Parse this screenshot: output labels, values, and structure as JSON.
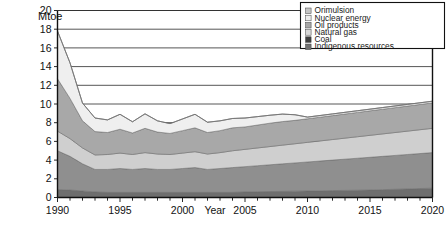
{
  "chart_data": {
    "type": "area",
    "stacked": true,
    "title": "",
    "unit_label": "Mtoe",
    "xlabel": "Year",
    "ylabel": "",
    "xlim": [
      1990,
      2020
    ],
    "ylim": [
      0,
      20
    ],
    "ytick_step": 2,
    "yticks": [
      0,
      2,
      4,
      6,
      8,
      10,
      12,
      14,
      16,
      18,
      20
    ],
    "xticks_labeled": [
      1990,
      1995,
      2000,
      2005,
      2010,
      2015,
      2020
    ],
    "xtick_step_minor": 1,
    "grid": "horizontal",
    "legend_position": "top-right",
    "x": [
      1990,
      1991,
      1992,
      1993,
      1994,
      1995,
      1996,
      1997,
      1998,
      1999,
      2000,
      2001,
      2002,
      2003,
      2004,
      2005,
      2006,
      2007,
      2008,
      2009,
      2010,
      2011,
      2012,
      2013,
      2014,
      2015,
      2016,
      2017,
      2018,
      2019,
      2020
    ],
    "series": [
      {
        "name": "Indigenous resources",
        "color": "#6e6e6e",
        "values": [
          0.85,
          0.8,
          0.7,
          0.6,
          0.55,
          0.55,
          0.55,
          0.55,
          0.55,
          0.55,
          0.55,
          0.55,
          0.55,
          0.55,
          0.55,
          0.6,
          0.62,
          0.64,
          0.66,
          0.68,
          0.7,
          0.72,
          0.74,
          0.76,
          0.78,
          0.8,
          0.84,
          0.88,
          0.92,
          0.96,
          1.0
        ]
      },
      {
        "name": "Coal",
        "color": "#8f8f8f",
        "values": [
          4.15,
          3.6,
          2.9,
          2.4,
          2.45,
          2.55,
          2.45,
          2.55,
          2.45,
          2.45,
          2.55,
          2.65,
          2.45,
          2.55,
          2.65,
          2.7,
          2.78,
          2.86,
          2.94,
          3.02,
          3.1,
          3.18,
          3.26,
          3.34,
          3.42,
          3.5,
          3.56,
          3.62,
          3.68,
          3.74,
          3.8
        ]
      },
      {
        "name": "Natural gas",
        "color": "#cfcfcf",
        "values": [
          2.1,
          1.9,
          1.7,
          1.55,
          1.6,
          1.65,
          1.6,
          1.7,
          1.65,
          1.6,
          1.65,
          1.7,
          1.65,
          1.7,
          1.8,
          1.85,
          1.9,
          1.95,
          2.0,
          2.05,
          2.1,
          2.15,
          2.2,
          2.25,
          2.3,
          2.35,
          2.4,
          2.45,
          2.5,
          2.55,
          2.6
        ]
      },
      {
        "name": "Oil products",
        "color": "#a8a8a8",
        "values": [
          5.6,
          4.3,
          2.9,
          2.5,
          2.35,
          2.55,
          2.3,
          2.6,
          2.35,
          2.25,
          2.4,
          2.55,
          2.3,
          2.35,
          2.45,
          2.4,
          2.45,
          2.5,
          2.52,
          2.5,
          2.52,
          2.54,
          2.56,
          2.58,
          2.6,
          2.62,
          2.64,
          2.66,
          2.68,
          2.7,
          2.72
        ]
      },
      {
        "name": "Nuclear energy",
        "color": "#efefef",
        "values": [
          5.1,
          3.8,
          1.9,
          1.45,
          1.35,
          1.6,
          1.2,
          1.55,
          1.2,
          1.05,
          1.25,
          1.45,
          1.1,
          1.05,
          1.0,
          0.95,
          0.9,
          0.85,
          0.8,
          0.6,
          0.18,
          0.18,
          0.18,
          0.18,
          0.18,
          0.18,
          0.18,
          0.18,
          0.18,
          0.18,
          0.18
        ]
      },
      {
        "name": "Orimulsion",
        "color": "#bdbdbd",
        "values": [
          0.0,
          0.0,
          0.0,
          0.0,
          0.0,
          0.0,
          0.0,
          0.0,
          0.0,
          0.0,
          0.0,
          0.0,
          0.0,
          0.0,
          0.0,
          0.0,
          0.0,
          0.0,
          0.0,
          0.0,
          0.0,
          0.0,
          0.0,
          0.0,
          0.0,
          0.0,
          0.0,
          0.0,
          0.0,
          0.0,
          0.0
        ]
      }
    ],
    "totals": [
      17.8,
      14.4,
      10.1,
      8.5,
      8.3,
      8.9,
      8.1,
      8.95,
      8.2,
      7.9,
      8.4,
      8.9,
      8.05,
      8.2,
      8.45,
      8.5,
      8.65,
      8.8,
      8.92,
      8.85,
      8.6,
      8.77,
      8.94,
      9.11,
      9.28,
      9.45,
      9.62,
      9.79,
      9.96,
      10.13,
      10.3
    ]
  },
  "legend": {
    "items": [
      {
        "label": "Orimulsion",
        "swatch": "#c4c4c4"
      },
      {
        "label": "Nuclear energy",
        "swatch": "#ececec"
      },
      {
        "label": "Oil products",
        "swatch": "#a6a6a6"
      },
      {
        "label": "Natural gas",
        "swatch": "#d8d8d8"
      },
      {
        "label": "Coal",
        "swatch": "#3f3f3f"
      },
      {
        "label": "Indigenous resources",
        "swatch": "#717171"
      }
    ]
  },
  "axis": {
    "y_labels": [
      "20",
      "18",
      "16",
      "14",
      "12",
      "10",
      "8",
      "6",
      "4",
      "2",
      "0"
    ],
    "x_labels": [
      "1990",
      "1995",
      "2000",
      "2005",
      "2010",
      "2015",
      "2020"
    ],
    "x_axis_title": "Year",
    "unit": "Mtoe"
  }
}
